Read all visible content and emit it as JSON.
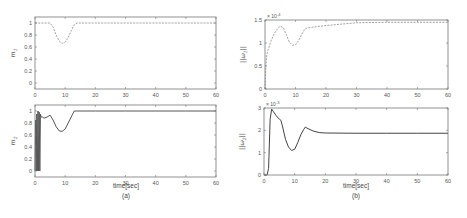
{
  "figure": {
    "panels": [
      {
        "id": "a",
        "caption": "(a)",
        "xlabel": "time[sec]"
      },
      {
        "id": "b",
        "caption": "(b)",
        "xlabel": "time[sec]"
      }
    ]
  },
  "chart_data": [
    {
      "type": "line",
      "panel": "a-top",
      "title": "",
      "xlabel": "",
      "ylabel": "m_1",
      "xlim": [
        0,
        60
      ],
      "ylim": [
        -0.1,
        1.1
      ],
      "xticks": [
        0,
        10,
        20,
        30,
        40,
        50,
        60
      ],
      "yticks": [
        0,
        0.2,
        0.4,
        0.6,
        0.8,
        1
      ],
      "ytick_labels": [
        "0",
        "0.2",
        "0.4",
        "0.6",
        "0.8",
        "1"
      ],
      "grid": false,
      "series": [
        {
          "name": "m1",
          "style": "dashed",
          "color": "#888888",
          "x": [
            0,
            5,
            6,
            7,
            8,
            9,
            10,
            11,
            12,
            13,
            14,
            20,
            30,
            40,
            50,
            60
          ],
          "y": [
            1,
            1,
            0.93,
            0.8,
            0.7,
            0.66,
            0.68,
            0.76,
            0.87,
            0.97,
            1,
            1,
            1,
            1,
            1,
            1
          ]
        }
      ]
    },
    {
      "type": "line",
      "panel": "a-bottom",
      "title": "",
      "xlabel": "time[sec]",
      "ylabel": "m_2",
      "xlim": [
        0,
        60
      ],
      "ylim": [
        -0.1,
        1.1
      ],
      "xticks": [
        0,
        10,
        20,
        30,
        40,
        50,
        60
      ],
      "yticks": [
        0,
        0.2,
        0.4,
        0.6,
        0.8,
        1
      ],
      "ytick_labels": [
        "0",
        "0.2",
        "0.4",
        "0.6",
        "0.8",
        "1"
      ],
      "grid": false,
      "series": [
        {
          "name": "m2",
          "style": "solid",
          "color": "#555555",
          "x": [
            0,
            0.2,
            0.4,
            0.6,
            0.8,
            1.0,
            1.2,
            1.4,
            1.6,
            1.8,
            2.0,
            2.5,
            3,
            4,
            5,
            6,
            7,
            8,
            9,
            10,
            11,
            12,
            13,
            14,
            20,
            30,
            40,
            50,
            60
          ],
          "y": [
            0,
            0.85,
            0,
            0.95,
            0,
            1.0,
            0,
            0.98,
            0,
            0.95,
            0.9,
            0.9,
            0.88,
            0.9,
            0.93,
            0.85,
            0.74,
            0.67,
            0.66,
            0.7,
            0.8,
            0.9,
            1,
            1,
            1,
            1,
            1,
            1,
            1
          ]
        }
      ]
    },
    {
      "type": "line",
      "panel": "b-top",
      "title": "",
      "xlabel": "",
      "ylabel": "||ω1||",
      "y_multiplier": "× 10^-4",
      "xlim": [
        0,
        60
      ],
      "ylim": [
        0,
        1.5
      ],
      "xticks": [
        0,
        10,
        20,
        30,
        40,
        50,
        60
      ],
      "yticks": [
        0,
        0.5,
        1,
        1.5
      ],
      "ytick_labels": [
        "0",
        "0.5",
        "1",
        "1.5"
      ],
      "grid": false,
      "series": [
        {
          "name": "omega1",
          "style": "dashed",
          "color": "#888888",
          "x": [
            0,
            0.3,
            0.6,
            1,
            2,
            3,
            4,
            5,
            6,
            7,
            8,
            9,
            10,
            11,
            12,
            13,
            14,
            20,
            30,
            40,
            50,
            60
          ],
          "y": [
            0,
            0.5,
            0.75,
            0.85,
            1.05,
            1.2,
            1.3,
            1.37,
            1.33,
            1.18,
            1.02,
            0.95,
            0.96,
            1.05,
            1.18,
            1.3,
            1.33,
            1.38,
            1.44,
            1.45,
            1.45,
            1.45
          ]
        }
      ]
    },
    {
      "type": "line",
      "panel": "b-bottom",
      "title": "",
      "xlabel": "time[sec]",
      "ylabel": "||ω2||",
      "y_multiplier": "× 10^-3",
      "xlim": [
        0,
        60
      ],
      "ylim": [
        0,
        3
      ],
      "xticks": [
        0,
        10,
        20,
        30,
        40,
        50,
        60
      ],
      "yticks": [
        0,
        1,
        2,
        3
      ],
      "ytick_labels": [
        "0",
        "1",
        "2",
        "3"
      ],
      "grid": false,
      "series": [
        {
          "name": "omega2",
          "style": "solid",
          "color": "#444444",
          "x": [
            0,
            1,
            1.5,
            2,
            2.5,
            3,
            4,
            5,
            5.5,
            6,
            7,
            8,
            9,
            10,
            11,
            12,
            13,
            13.5,
            14,
            16,
            18,
            20,
            30,
            40,
            50,
            60
          ],
          "y": [
            0,
            0,
            0.3,
            2.5,
            2.95,
            2.85,
            2.65,
            2.5,
            2.45,
            2.2,
            1.6,
            1.25,
            1.1,
            1.15,
            1.45,
            1.8,
            2.05,
            2.15,
            2.1,
            1.97,
            1.9,
            1.88,
            1.87,
            1.87,
            1.87,
            1.87
          ]
        }
      ]
    }
  ]
}
